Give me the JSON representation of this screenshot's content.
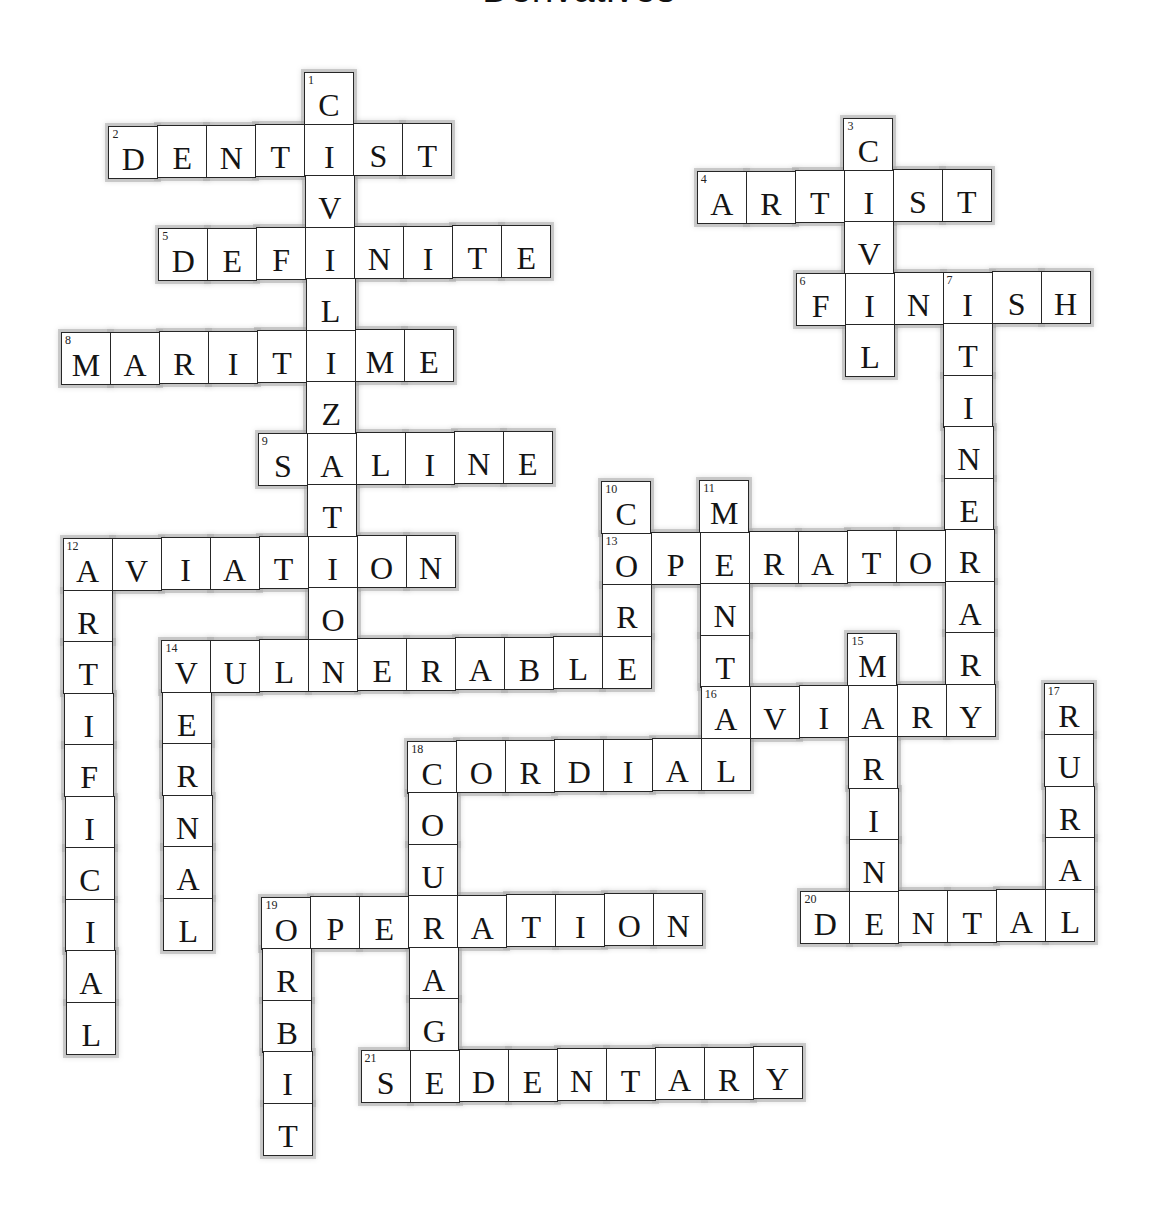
{
  "title": "Derivatives",
  "grid": {
    "origin_x": 59,
    "origin_y": 72,
    "cell_w": 49,
    "cell_h": 51.5,
    "skew_x_per_row": 0.4,
    "skew_y_per_col": -0.5,
    "skew_col_ref": 5
  },
  "words": [
    {
      "number": 1,
      "direction": "down",
      "answer": "CIVILIZATION",
      "row": 0,
      "col": 5
    },
    {
      "number": 2,
      "direction": "across",
      "answer": "DENTIST",
      "row": 1,
      "col": 1
    },
    {
      "number": 3,
      "direction": "down",
      "answer": "CIVIL",
      "row": 1,
      "col": 16
    },
    {
      "number": 4,
      "direction": "across",
      "answer": "ARTIST",
      "row": 2,
      "col": 13
    },
    {
      "number": 5,
      "direction": "across",
      "answer": "DEFINITE",
      "row": 3,
      "col": 2
    },
    {
      "number": 6,
      "direction": "across",
      "answer": "FINISH",
      "row": 4,
      "col": 15
    },
    {
      "number": 7,
      "direction": "down",
      "answer": "ITINERARY",
      "row": 4,
      "col": 18
    },
    {
      "number": 8,
      "direction": "across",
      "answer": "MARITIME",
      "row": 5,
      "col": 0
    },
    {
      "number": 9,
      "direction": "across",
      "answer": "SALINE",
      "row": 7,
      "col": 4
    },
    {
      "number": 10,
      "direction": "down",
      "answer": "CORE",
      "row": 8,
      "col": 11
    },
    {
      "number": 11,
      "direction": "down",
      "answer": "MENTAL",
      "row": 8,
      "col": 13
    },
    {
      "number": 12,
      "direction": "across",
      "answer": "AVIATION",
      "row": 9,
      "col": 0
    },
    {
      "number": 12,
      "direction": "down",
      "answer": "ARTIFICIAL",
      "row": 9,
      "col": 0
    },
    {
      "number": 13,
      "direction": "across",
      "answer": "OPERATOR",
      "row": 9,
      "col": 11
    },
    {
      "number": 14,
      "direction": "across",
      "answer": "VULNERABLE",
      "row": 11,
      "col": 2
    },
    {
      "number": 14,
      "direction": "down",
      "answer": "VERNAL",
      "row": 11,
      "col": 2
    },
    {
      "number": 15,
      "direction": "down",
      "answer": "MARINE",
      "row": 11,
      "col": 16
    },
    {
      "number": 16,
      "direction": "across",
      "answer": "AVIARY",
      "row": 12,
      "col": 13
    },
    {
      "number": 17,
      "direction": "down",
      "answer": "RURAL",
      "row": 12,
      "col": 20
    },
    {
      "number": 18,
      "direction": "across",
      "answer": "CORDIAL",
      "row": 13,
      "col": 7
    },
    {
      "number": 18,
      "direction": "down",
      "answer": "COURAGE",
      "row": 13,
      "col": 7
    },
    {
      "number": 19,
      "direction": "across",
      "answer": "OPERATION",
      "row": 16,
      "col": 4
    },
    {
      "number": 19,
      "direction": "down",
      "answer": "ORBIT",
      "row": 16,
      "col": 4
    },
    {
      "number": 20,
      "direction": "across",
      "answer": "DENTAL",
      "row": 16,
      "col": 15
    },
    {
      "number": 21,
      "direction": "across",
      "answer": "SEDENTARY",
      "row": 19,
      "col": 6
    }
  ],
  "colors": {
    "cell_border": "#262626",
    "cell_fill": "#ffffff",
    "halo": "#aaaaaa",
    "text": "#141414"
  }
}
